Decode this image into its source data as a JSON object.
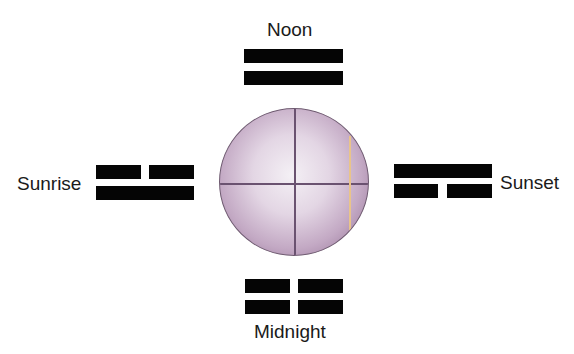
{
  "diagram": {
    "center": {
      "shape": "sphere",
      "color": "#b89cbb",
      "line_color": "#6a5270",
      "highlight_line_color": "#e9c48a"
    },
    "positions": [
      {
        "id": "noon",
        "label": "Noon",
        "lines_top_to_bottom": [
          "solid",
          "solid"
        ]
      },
      {
        "id": "sunrise",
        "label": "Sunrise",
        "lines_top_to_bottom": [
          "broken",
          "solid"
        ]
      },
      {
        "id": "sunset",
        "label": "Sunset",
        "lines_top_to_bottom": [
          "solid",
          "broken"
        ]
      },
      {
        "id": "midnight",
        "label": "Midnight",
        "lines_top_to_bottom": [
          "broken",
          "broken"
        ]
      }
    ]
  }
}
